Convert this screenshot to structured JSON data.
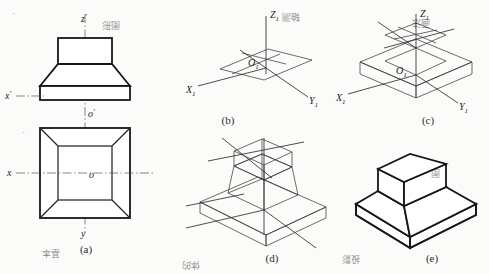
{
  "figure": {
    "background_color": "#fbfbf9",
    "line_color": "#171717"
  },
  "panels": [
    {
      "id": "a",
      "caption": "(a)",
      "type": "orthographic-views",
      "labels": [
        {
          "name": "z-prime",
          "text": "z",
          "prime": "′"
        },
        {
          "name": "x-prime",
          "text": "x",
          "prime": "′"
        },
        {
          "name": "o-prime",
          "text": "o",
          "prime": "′"
        },
        {
          "name": "x-axis",
          "text": "x",
          "prime": ""
        },
        {
          "name": "y-axis",
          "text": "y",
          "prime": ""
        },
        {
          "name": "origin",
          "text": "o",
          "prime": ""
        }
      ]
    },
    {
      "id": "b",
      "caption": "(b)",
      "type": "axonometric-axes",
      "labels": [
        {
          "name": "z1",
          "base": "Z",
          "sub": "1"
        },
        {
          "name": "x1",
          "base": "X",
          "sub": "1"
        },
        {
          "name": "y1",
          "base": "Y",
          "sub": "1"
        },
        {
          "name": "o1",
          "base": "O",
          "sub": "1"
        }
      ]
    },
    {
      "id": "c",
      "caption": "(c)",
      "type": "base-slab-construction",
      "labels": [
        {
          "name": "z1",
          "base": "Z",
          "sub": "1"
        },
        {
          "name": "x1",
          "base": "X",
          "sub": "1"
        },
        {
          "name": "y1",
          "base": "Y",
          "sub": "1"
        },
        {
          "name": "o1",
          "base": "O",
          "sub": "1"
        }
      ]
    },
    {
      "id": "d",
      "caption": "(d)",
      "type": "wireframe-construction",
      "labels": []
    },
    {
      "id": "e",
      "caption": "(e)",
      "type": "finished-solid",
      "labels": []
    }
  ],
  "captions": {
    "a": "(a)",
    "b": "(b)",
    "c": "(c)",
    "d": "(d)",
    "e": "(e)"
  }
}
